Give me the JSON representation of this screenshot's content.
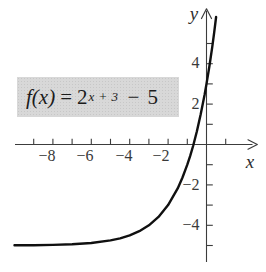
{
  "formula": {
    "func": "f(x)",
    "eq": "=",
    "base": "2",
    "exponent": "x + 3",
    "operator": "−",
    "constant": "5"
  },
  "chart_data": {
    "type": "line",
    "function": "f(x) = 2^(x+3) − 5",
    "xlabel": "x",
    "ylabel": "y",
    "xlim": [
      -10,
      2.8
    ],
    "ylim": [
      -6.3,
      6.8
    ],
    "grid": false,
    "x_ticks": [
      -9,
      -8,
      -7,
      -6,
      -5,
      -4,
      -3,
      -2,
      -1,
      1
    ],
    "x_labeled_ticks": [
      -8,
      -6,
      -4,
      -2
    ],
    "x_tick_labels": [
      "−8",
      "−6",
      "−4",
      "−2"
    ],
    "y_ticks": [
      5,
      4,
      3,
      2,
      1,
      -1,
      -2,
      -3,
      -4,
      -5
    ],
    "y_labeled_ticks": [
      4,
      2,
      -2,
      -4
    ],
    "y_tick_labels": [
      "4",
      "2",
      "−2",
      "−4"
    ],
    "horizontal_asymptote_y": -5,
    "y_intercept": 3,
    "x_intercept": -0.678,
    "series": [
      {
        "name": "f(x) = 2^(x+3) − 5",
        "points": [
          [
            -10,
            -4.992
          ],
          [
            -9,
            -4.984
          ],
          [
            -8,
            -4.969
          ],
          [
            -7,
            -4.938
          ],
          [
            -6,
            -4.875
          ],
          [
            -5,
            -4.75
          ],
          [
            -4.5,
            -4.646
          ],
          [
            -4,
            -4.5
          ],
          [
            -3.5,
            -4.293
          ],
          [
            -3,
            -4
          ],
          [
            -2.5,
            -3.586
          ],
          [
            -2,
            -3
          ],
          [
            -1.5,
            -2.172
          ],
          [
            -1.25,
            -1.636
          ],
          [
            -1,
            -1
          ],
          [
            -0.85,
            -0.562
          ],
          [
            -0.7,
            -0.075
          ],
          [
            -0.5,
            0.657
          ],
          [
            -0.3,
            1.495
          ],
          [
            -0.1,
            2.464
          ],
          [
            0,
            3
          ],
          [
            0.15,
            3.876
          ],
          [
            0.3,
            4.849
          ],
          [
            0.4,
            5.556
          ],
          [
            0.5,
            6.314
          ]
        ]
      }
    ]
  }
}
